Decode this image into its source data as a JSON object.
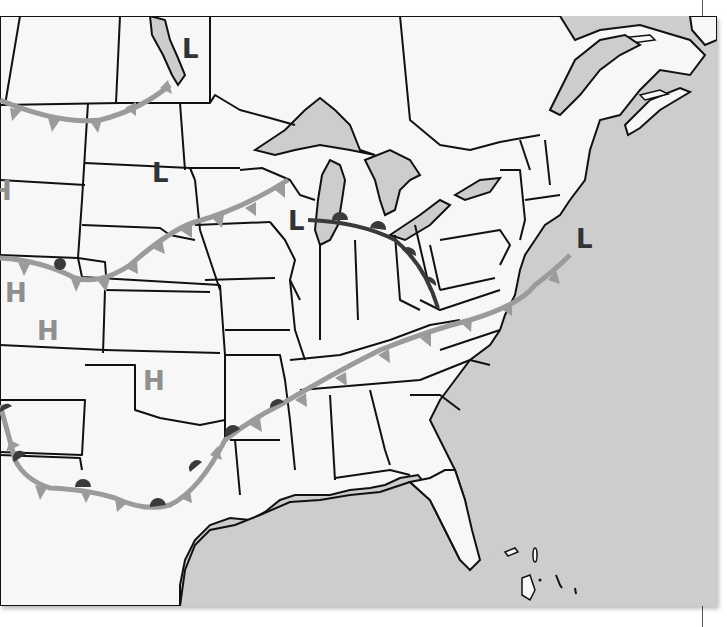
{
  "map": {
    "title": "",
    "region": "Central and Eastern United States weather map",
    "colors": {
      "land": "#f7f7f7",
      "water": "#cdcdcd",
      "border": "#111111",
      "cold_front": "#9b9b9b",
      "warm_front_dark": "#3a3a3a",
      "high_label": "#8f8f8f",
      "low_label": "#333333"
    },
    "pressure_systems": [
      {
        "type": "low",
        "label": "L",
        "location": "Lake Winnipeg area"
      },
      {
        "type": "low",
        "label": "L",
        "location": "South Dakota"
      },
      {
        "type": "low",
        "label": "L",
        "location": "Wisconsin"
      },
      {
        "type": "low",
        "label": "L",
        "location": "Atlantic off New England"
      },
      {
        "type": "high",
        "label": "H",
        "location": "Western edge (partial)"
      },
      {
        "type": "high",
        "label": "H",
        "location": "Utah"
      },
      {
        "type": "high",
        "label": "H",
        "location": "Colorado"
      },
      {
        "type": "high",
        "label": "H",
        "location": "Oklahoma"
      }
    ],
    "fronts": [
      {
        "type": "cold",
        "name": "northern-cold-front",
        "from": "Montana",
        "to": "Manitoba"
      },
      {
        "type": "cold",
        "name": "central-cold-front",
        "from": "Utah",
        "to": "Wisconsin"
      },
      {
        "type": "warm",
        "name": "great-lakes-warm-front",
        "from": "Wisconsin",
        "to": "West Virginia"
      },
      {
        "type": "stationary",
        "name": "southern-stationary-front",
        "from": "Arizona",
        "to": "Atlantic off Virginia"
      }
    ]
  }
}
